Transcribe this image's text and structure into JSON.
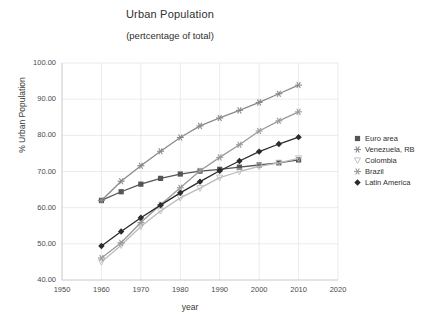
{
  "chart_data": {
    "type": "line",
    "title": "Urban Population",
    "subtitle": "(pertcentage of  total)",
    "xlabel": "year",
    "ylabel": "% Urban Population",
    "xlim": [
      1950,
      2020
    ],
    "ylim": [
      40.0,
      100.0
    ],
    "grid": true,
    "legend_position": "right",
    "x": [
      1960,
      1965,
      1970,
      1975,
      1980,
      1985,
      1990,
      1995,
      2000,
      2005,
      2010
    ],
    "xticks": [
      "1950",
      "1960",
      "1970",
      "1980",
      "1990",
      "2000",
      "2010",
      "2020"
    ],
    "yticks": [
      "40.00",
      "50.00",
      "60.00",
      "70.00",
      "80.00",
      "90.00",
      "100.00"
    ],
    "series": [
      {
        "name": "Euro area",
        "color": "#555555",
        "marker": "square",
        "values": [
          62.0,
          64.4,
          66.5,
          68.1,
          69.3,
          70.1,
          70.6,
          71.2,
          71.8,
          72.4,
          73.2
        ]
      },
      {
        "name": "Venezuela, RB",
        "color": "#8a8a8a",
        "marker": "star",
        "values": [
          62.0,
          67.3,
          71.6,
          75.6,
          79.4,
          82.6,
          84.8,
          86.9,
          89.1,
          91.5,
          93.9
        ]
      },
      {
        "name": "Colombia",
        "color": "#bcbcbc",
        "marker": "triangle-down",
        "values": [
          45.0,
          49.6,
          54.8,
          59.1,
          62.7,
          65.4,
          68.3,
          70.0,
          71.4,
          72.4,
          73.6
        ]
      },
      {
        "name": "Brazil",
        "color": "#9a9a9a",
        "marker": "asterisk",
        "values": [
          46.1,
          50.3,
          55.9,
          60.8,
          65.5,
          70.2,
          73.9,
          77.4,
          81.2,
          84.0,
          86.5
        ]
      },
      {
        "name": "Latin America",
        "color": "#2b2b2b",
        "marker": "diamond",
        "values": [
          49.4,
          53.4,
          57.2,
          60.7,
          64.1,
          67.2,
          70.2,
          72.9,
          75.5,
          77.6,
          79.5
        ]
      }
    ]
  },
  "legend": {
    "items": [
      {
        "label": "Euro area"
      },
      {
        "label": "Venezuela, RB"
      },
      {
        "label": "Colombia"
      },
      {
        "label": "Brazil"
      },
      {
        "label": "Latin America"
      }
    ]
  }
}
